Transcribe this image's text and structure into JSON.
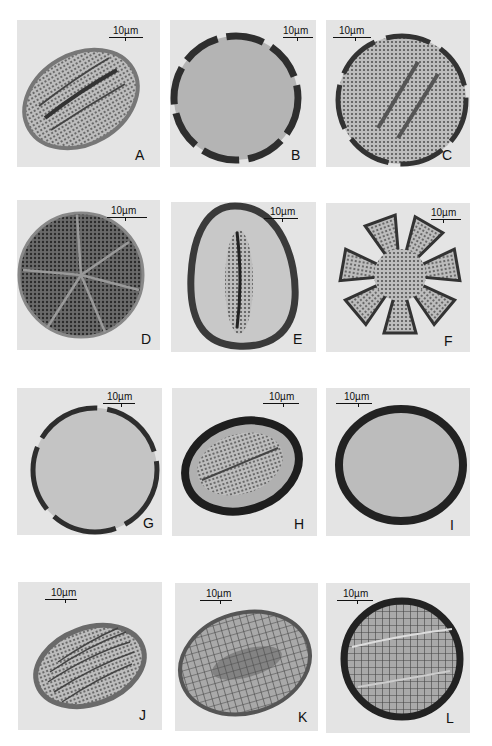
{
  "figure": {
    "scale_label": "10µm",
    "panels": [
      {
        "id": "A",
        "label": "A",
        "scale": "10µm"
      },
      {
        "id": "B",
        "label": "B",
        "scale": "10µm"
      },
      {
        "id": "C",
        "label": "C",
        "scale": "10µm"
      },
      {
        "id": "D",
        "label": "D",
        "scale": "10µm"
      },
      {
        "id": "E",
        "label": "E",
        "scale": "10µm"
      },
      {
        "id": "F",
        "label": "F",
        "scale": "10µm"
      },
      {
        "id": "G",
        "label": "G",
        "scale": "10µm"
      },
      {
        "id": "H",
        "label": "H",
        "scale": "10µm"
      },
      {
        "id": "I",
        "label": "I",
        "scale": "10µm"
      },
      {
        "id": "J",
        "label": "J",
        "scale": "10µm"
      },
      {
        "id": "K",
        "label": "K",
        "scale": "10µm"
      },
      {
        "id": "L",
        "label": "L",
        "scale": "10µm"
      }
    ]
  }
}
